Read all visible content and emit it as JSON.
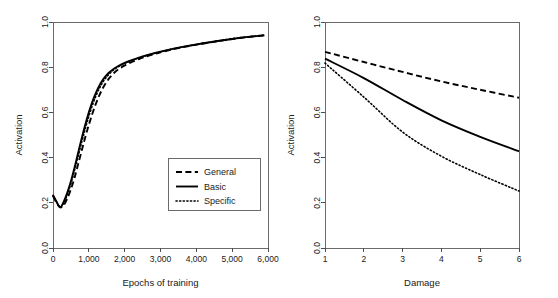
{
  "figure": {
    "background": "#ffffff",
    "series_color": "#000000",
    "axis_color": "#4d4d4d"
  },
  "chart_data": [
    {
      "type": "line",
      "panel": "left",
      "title": "",
      "xlabel": "Epochs of training",
      "ylabel": "Activation",
      "xlim": [
        0,
        6000
      ],
      "ylim": [
        0.0,
        1.0
      ],
      "xticks": [
        0,
        1000,
        2000,
        3000,
        4000,
        5000,
        6000
      ],
      "xticklabels": [
        "0",
        "1,000",
        "2,000",
        "3,000",
        "4,000",
        "5,000",
        "6,000"
      ],
      "yticks": [
        0.0,
        0.2,
        0.4,
        0.6,
        0.8,
        1.0
      ],
      "yticklabels": [
        "0.0",
        "0.2",
        "0.4",
        "0.6",
        "0.8",
        "1.0"
      ],
      "grid": false,
      "legend_position": "lower right",
      "x": [
        0,
        100,
        200,
        300,
        400,
        500,
        600,
        700,
        800,
        900,
        1000,
        1100,
        1200,
        1300,
        1400,
        1500,
        1600,
        1700,
        1800,
        2000,
        2200,
        2400,
        2600,
        2800,
        3000,
        3400,
        3800,
        4200,
        4600,
        5000,
        5400,
        5900
      ],
      "series": [
        {
          "name": "General",
          "style": "dashed",
          "values": [
            0.23,
            0.2,
            0.18,
            0.19,
            0.22,
            0.26,
            0.31,
            0.37,
            0.43,
            0.49,
            0.545,
            0.595,
            0.64,
            0.678,
            0.71,
            0.736,
            0.757,
            0.774,
            0.788,
            0.808,
            0.823,
            0.836,
            0.847,
            0.857,
            0.866,
            0.881,
            0.894,
            0.905,
            0.915,
            0.925,
            0.933,
            0.941
          ]
        },
        {
          "name": "Basic",
          "style": "solid",
          "values": [
            0.235,
            0.205,
            0.18,
            0.205,
            0.245,
            0.295,
            0.355,
            0.42,
            0.485,
            0.545,
            0.6,
            0.648,
            0.688,
            0.72,
            0.746,
            0.766,
            0.781,
            0.793,
            0.803,
            0.819,
            0.831,
            0.842,
            0.852,
            0.861,
            0.869,
            0.883,
            0.895,
            0.906,
            0.916,
            0.925,
            0.933,
            0.941
          ]
        },
        {
          "name": "Specific",
          "style": "dotted",
          "values": [
            0.232,
            0.203,
            0.18,
            0.2,
            0.237,
            0.285,
            0.343,
            0.405,
            0.468,
            0.528,
            0.583,
            0.632,
            0.674,
            0.708,
            0.736,
            0.758,
            0.775,
            0.789,
            0.8,
            0.817,
            0.83,
            0.841,
            0.851,
            0.86,
            0.868,
            0.883,
            0.895,
            0.906,
            0.916,
            0.926,
            0.934,
            0.942
          ]
        }
      ]
    },
    {
      "type": "line",
      "panel": "right",
      "title": "",
      "xlabel": "Damage",
      "ylabel": "Activation",
      "xlim": [
        1,
        6
      ],
      "ylim": [
        0.0,
        1.0
      ],
      "xticks": [
        1,
        2,
        3,
        4,
        5,
        6
      ],
      "xticklabels": [
        "1",
        "2",
        "3",
        "4",
        "5",
        "6"
      ],
      "yticks": [
        0.0,
        0.2,
        0.4,
        0.6,
        0.8,
        1.0
      ],
      "yticklabels": [
        "0.0",
        "0.2",
        "0.4",
        "0.6",
        "0.8",
        "1.0"
      ],
      "grid": false,
      "legend_position": "none",
      "x": [
        1,
        2,
        3,
        4,
        5,
        6
      ],
      "series": [
        {
          "name": "General",
          "style": "dashed",
          "values": [
            0.868,
            0.823,
            0.779,
            0.737,
            0.7,
            0.665
          ]
        },
        {
          "name": "Basic",
          "style": "solid",
          "values": [
            0.838,
            0.752,
            0.655,
            0.565,
            0.492,
            0.428
          ]
        },
        {
          "name": "Specific",
          "style": "dotted",
          "values": [
            0.818,
            0.668,
            0.513,
            0.406,
            0.325,
            0.252
          ]
        }
      ]
    }
  ],
  "legend": {
    "items": [
      {
        "label": "General",
        "style": "dashed"
      },
      {
        "label": "Basic",
        "style": "solid"
      },
      {
        "label": "Specific",
        "style": "dotted"
      }
    ]
  },
  "left_panel": {
    "ylabel": "Activation",
    "xlabel": "Epochs of training",
    "xticklabels": [
      "0",
      "1,000",
      "2,000",
      "3,000",
      "4,000",
      "5,000",
      "6,000"
    ],
    "yticklabels": [
      "0.0",
      "0.2",
      "0.4",
      "0.6",
      "0.8",
      "1.0"
    ]
  },
  "right_panel": {
    "ylabel": "Activation",
    "xlabel": "Damage",
    "xticklabels": [
      "1",
      "2",
      "3",
      "4",
      "5",
      "6"
    ],
    "yticklabels": [
      "0.0",
      "0.2",
      "0.4",
      "0.6",
      "0.8",
      "1.0"
    ]
  }
}
